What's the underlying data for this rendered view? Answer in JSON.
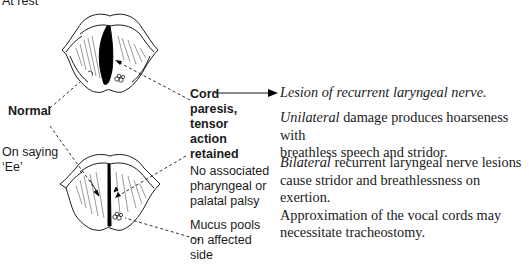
{
  "labels": {
    "at_rest": "At rest",
    "normal": "Normal",
    "on_saying_line1": "On saying",
    "on_saying_line2": "‘Ee’",
    "cord_paresis": [
      "Cord",
      "paresis,",
      "tensor",
      "action",
      "retained"
    ],
    "no_associated": [
      "No associated",
      "pharyngeal or",
      "palatal palsy"
    ],
    "mucus_pools": [
      "Mucus pools",
      "on affected",
      "side"
    ]
  },
  "right_text": {
    "lesion": "Lesion of recurrent laryngeal nerve.",
    "unilateral_em": "Unilateral",
    "unilateral_rest_line1": " damage produces hoarseness with",
    "unilateral_line2": "breathless speech and stridor.",
    "bilateral_em": "Bilateral",
    "bilateral_rest_line1": " recurrent laryngeal nerve lesions",
    "bilateral_line2": "cause stridor and breathlessness on exertion.",
    "bilateral_line3": "Approximation of the vocal cords may",
    "bilateral_line4": "necessitate tracheostomy."
  },
  "figures": [
    {
      "name": "larynx-at-rest",
      "state": "At rest"
    },
    {
      "name": "larynx-on-saying-ee",
      "state": "On saying ‘Ee’"
    }
  ]
}
